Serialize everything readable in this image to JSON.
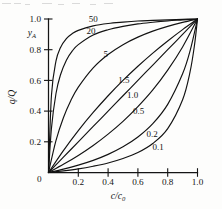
{
  "figure": {
    "name": "equilibrium-isotherm-family",
    "background": "#fdfdfc",
    "ink_color": "#121212"
  },
  "chart_data": {
    "type": "line",
    "title": "",
    "subtitle": "",
    "xlabel": "c/c0",
    "xlabel_numerator": "c",
    "xlabel_denominator": "c",
    "xlabel_denominator_sub": "0",
    "ylabel": "q/Q",
    "ylabel_numerator": "q",
    "ylabel_denominator": "Q",
    "ylabel_secondary": "y",
    "ylabel_secondary_sub": "A",
    "xlim": [
      0,
      1
    ],
    "ylim": [
      0,
      1
    ],
    "grid": false,
    "legend": "inline-curve-labels",
    "xticks": [
      0,
      0.2,
      0.4,
      0.6,
      0.8,
      1.0
    ],
    "xticklabels": [
      "0",
      "0.2",
      "0.4",
      "0.6",
      "0.8",
      "1.0"
    ],
    "yticks": [
      0,
      0.2,
      0.4,
      0.6,
      0.8,
      1.0
    ],
    "yticklabels": [
      "0",
      "0.2",
      "0.4",
      "0.6",
      "0.8",
      "1.0"
    ],
    "equation": "y = Rx / (1 + (R-1)x)",
    "parameter_name": "R",
    "series": [
      {
        "name": "50",
        "label": "50",
        "R": 50,
        "label_x": 0.3,
        "label_y": 1.0,
        "x": [
          0,
          0.02,
          0.05,
          0.08,
          0.12,
          0.16,
          0.2,
          0.3,
          0.4,
          0.5,
          0.6,
          0.7,
          0.8,
          0.9,
          1.0
        ],
        "y": [
          0,
          0.505,
          0.725,
          0.813,
          0.872,
          0.905,
          0.926,
          0.955,
          0.971,
          0.98,
          0.987,
          0.991,
          0.995,
          0.998,
          1.0
        ]
      },
      {
        "name": "20",
        "label": "20",
        "R": 20,
        "label_x": 0.285,
        "label_y": 0.925,
        "x": [
          0,
          0.02,
          0.05,
          0.08,
          0.12,
          0.16,
          0.2,
          0.3,
          0.4,
          0.5,
          0.6,
          0.7,
          0.8,
          0.9,
          1.0
        ],
        "y": [
          0,
          0.29,
          0.513,
          0.635,
          0.732,
          0.792,
          0.833,
          0.896,
          0.93,
          0.952,
          0.968,
          0.979,
          0.988,
          0.994,
          1.0
        ]
      },
      {
        "name": "5",
        "label": "5",
        "R": 5,
        "label_x": 0.385,
        "label_y": 0.775,
        "x": [
          0,
          0.05,
          0.1,
          0.15,
          0.2,
          0.3,
          0.4,
          0.5,
          0.6,
          0.7,
          0.8,
          0.9,
          1.0
        ],
        "y": [
          0,
          0.208,
          0.357,
          0.469,
          0.556,
          0.682,
          0.769,
          0.833,
          0.882,
          0.921,
          0.952,
          0.978,
          1.0
        ]
      },
      {
        "name": "1.5",
        "label": "1.5",
        "R": 1.5,
        "label_x": 0.505,
        "label_y": 0.605,
        "x": [
          0,
          0.1,
          0.2,
          0.3,
          0.4,
          0.5,
          0.6,
          0.7,
          0.8,
          0.9,
          1.0
        ],
        "y": [
          0,
          0.143,
          0.273,
          0.391,
          0.5,
          0.6,
          0.692,
          0.778,
          0.857,
          0.931,
          1.0
        ]
      },
      {
        "name": "1.0",
        "label": "1.0",
        "R": 1.0,
        "label_x": 0.565,
        "label_y": 0.505,
        "x": [
          0,
          0.1,
          0.2,
          0.3,
          0.4,
          0.5,
          0.6,
          0.7,
          0.8,
          0.9,
          1.0
        ],
        "y": [
          0,
          0.1,
          0.2,
          0.3,
          0.4,
          0.5,
          0.6,
          0.7,
          0.8,
          0.9,
          1.0
        ]
      },
      {
        "name": "0.5",
        "label": "0.5",
        "R": 0.5,
        "label_x": 0.605,
        "label_y": 0.405,
        "x": [
          0,
          0.1,
          0.2,
          0.3,
          0.4,
          0.5,
          0.6,
          0.7,
          0.8,
          0.9,
          1.0
        ],
        "y": [
          0,
          0.053,
          0.111,
          0.176,
          0.25,
          0.333,
          0.429,
          0.538,
          0.667,
          0.818,
          1.0
        ]
      },
      {
        "name": "0.2",
        "label": "0.2",
        "R": 0.2,
        "label_x": 0.695,
        "label_y": 0.255,
        "x": [
          0,
          0.1,
          0.2,
          0.3,
          0.4,
          0.5,
          0.6,
          0.7,
          0.8,
          0.9,
          0.95,
          1.0
        ],
        "y": [
          0,
          0.022,
          0.048,
          0.079,
          0.118,
          0.167,
          0.231,
          0.318,
          0.444,
          0.643,
          0.792,
          1.0
        ]
      },
      {
        "name": "0.1",
        "label": "0.1",
        "R": 0.1,
        "label_x": 0.735,
        "label_y": 0.165,
        "x": [
          0,
          0.1,
          0.2,
          0.3,
          0.4,
          0.5,
          0.6,
          0.7,
          0.8,
          0.9,
          0.95,
          0.98,
          1.0
        ],
        "y": [
          0,
          0.011,
          0.024,
          0.041,
          0.062,
          0.091,
          0.13,
          0.189,
          0.286,
          0.474,
          0.655,
          0.831,
          1.0
        ]
      }
    ]
  }
}
